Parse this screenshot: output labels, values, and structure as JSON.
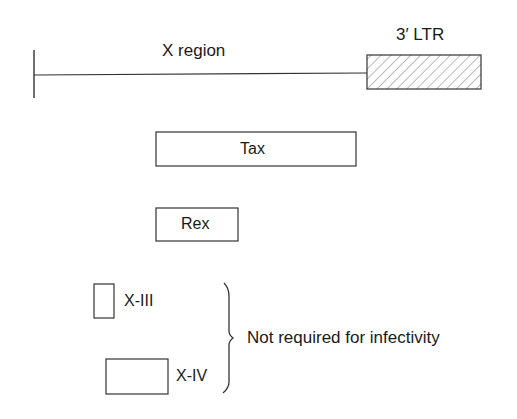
{
  "diagram": {
    "genome": {
      "region_label": "X region",
      "ltr_label": "3′ LTR"
    },
    "genes": [
      {
        "id": "tax",
        "label": "Tax"
      },
      {
        "id": "rex",
        "label": "Rex"
      },
      {
        "id": "x-iii",
        "label": "X-III"
      },
      {
        "id": "x-iv",
        "label": "X-IV"
      }
    ],
    "bracket_annotation": "Not required for infectivity",
    "colors": {
      "stroke": "#333333",
      "text": "#1a1a1a",
      "background": "#ffffff"
    }
  }
}
